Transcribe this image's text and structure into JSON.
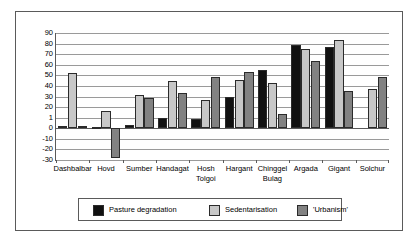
{
  "chart_data": {
    "type": "bar",
    "title": "",
    "xlabel": "",
    "ylabel": "",
    "ylim": [
      -30,
      90
    ],
    "grid": true,
    "legend_position": "bottom",
    "categories": [
      "Dashbalbar",
      "Hovd",
      "Sumber",
      "Handagat",
      "Hosh\nTolgoi",
      "Hargant",
      "Chinggel\nBulag",
      "Argada",
      "Gigant",
      "Solchur"
    ],
    "ytick_labels": [
      "90",
      "80",
      "70",
      "60",
      "50",
      "40",
      "30",
      "20",
      "1",
      "0",
      "-10",
      "-20",
      "-30"
    ],
    "ytick_values": [
      90,
      80,
      70,
      60,
      50,
      40,
      30,
      20,
      10,
      0,
      -10,
      -20,
      -30
    ],
    "series": [
      {
        "name": "Pasture degradation",
        "color": "#111111",
        "values": [
          2,
          1,
          3,
          10,
          9,
          30,
          55,
          79,
          77,
          0
        ]
      },
      {
        "name": "Sedentarisation",
        "color": "#c8c8c8",
        "values": [
          52,
          16,
          31,
          45,
          27,
          46,
          43,
          75,
          83,
          37
        ]
      },
      {
        "name": "'Urbanism'",
        "color": "#828282",
        "values": [
          2,
          -28,
          29,
          33,
          48,
          53,
          13,
          64,
          35,
          48
        ]
      }
    ]
  }
}
